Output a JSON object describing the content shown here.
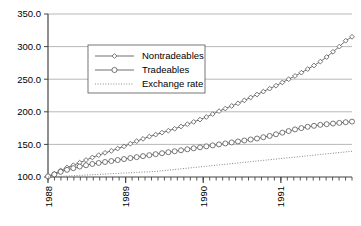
{
  "chart_data": {
    "type": "line",
    "title": "",
    "subtitle": "",
    "xlabel": "",
    "ylabel": "",
    "ylim": [
      100.0,
      350.0
    ],
    "yticks": [
      100.0,
      150.0,
      200.0,
      250.0,
      300.0,
      350.0
    ],
    "ytick_labels": [
      "100.0",
      "150.0",
      "200.0",
      "250.0",
      "300.0",
      "350.0"
    ],
    "xlim": [
      0,
      47
    ],
    "xtick_labels": [
      "1988",
      "1989",
      "1990",
      "1991"
    ],
    "xtick_positions": [
      0,
      12,
      24,
      36
    ],
    "x_minor_tick_count": 48,
    "grid": true,
    "grid_axis": "y",
    "legend_position": "upper-left-inset",
    "series": [
      {
        "name": "Nontradeables",
        "marker": "diamond",
        "line_style": "solid",
        "color": "#555555",
        "values": [
          101.0,
          105.0,
          110.0,
          114.5,
          118.0,
          122.0,
          126.0,
          130.0,
          133.5,
          137.0,
          140.0,
          143.5,
          147.0,
          151.0,
          155.0,
          158.5,
          162.0,
          165.0,
          168.0,
          171.0,
          174.0,
          177.5,
          181.0,
          184.5,
          188.0,
          192.0,
          196.5,
          201.0,
          205.0,
          209.0,
          213.0,
          217.5,
          222.0,
          226.5,
          231.0,
          235.5,
          240.0,
          245.0,
          250.0,
          255.0,
          260.0,
          265.5,
          271.0,
          277.0,
          284.0,
          292.0,
          300.0,
          309.0,
          315.0
        ]
      },
      {
        "name": "Tradeables",
        "marker": "circle",
        "line_style": "solid",
        "color": "#555555",
        "values": [
          101.0,
          104.0,
          108.0,
          111.0,
          113.5,
          116.0,
          118.0,
          120.0,
          121.5,
          123.0,
          124.5,
          126.0,
          127.5,
          129.0,
          130.5,
          132.0,
          133.5,
          135.0,
          136.5,
          138.0,
          139.5,
          141.0,
          142.5,
          144.0,
          145.5,
          147.0,
          148.5,
          150.0,
          151.5,
          153.0,
          154.5,
          156.0,
          157.5,
          159.0,
          161.0,
          163.0,
          165.5,
          168.0,
          170.5,
          173.0,
          175.0,
          177.0,
          178.5,
          180.0,
          181.0,
          182.0,
          183.0,
          184.0,
          185.0
        ]
      },
      {
        "name": "Exchange rate",
        "marker": "none",
        "line_style": "dotted",
        "color": "#777777",
        "values": [
          100.0,
          100.5,
          101.0,
          101.5,
          102.0,
          102.5,
          103.0,
          103.5,
          104.0,
          104.5,
          105.0,
          105.5,
          106.0,
          106.5,
          107.0,
          107.5,
          108.0,
          108.5,
          109.5,
          110.5,
          111.5,
          112.5,
          113.5,
          114.5,
          115.5,
          116.5,
          117.5,
          118.5,
          119.5,
          120.5,
          121.5,
          122.5,
          123.5,
          124.5,
          125.5,
          126.5,
          127.5,
          128.5,
          129.5,
          130.5,
          131.5,
          132.5,
          133.5,
          134.5,
          135.5,
          136.5,
          137.5,
          138.5,
          139.5
        ]
      }
    ]
  }
}
